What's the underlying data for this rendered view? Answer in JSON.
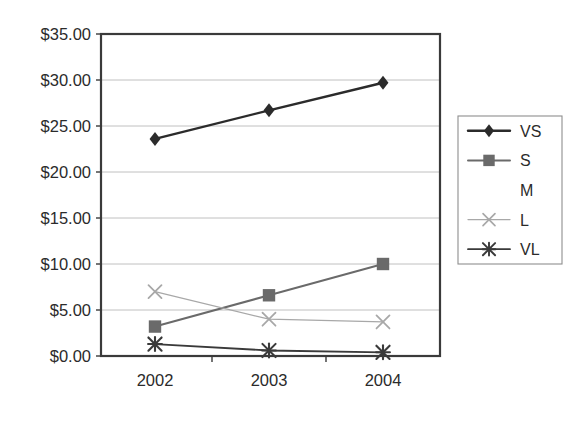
{
  "chart_data": {
    "type": "line",
    "title": "",
    "subtitle": "",
    "xlabel": "",
    "ylabel": "",
    "categories": [
      "2002",
      "2003",
      "2004"
    ],
    "x_tick_labels": [
      "2002",
      "2003",
      "2004"
    ],
    "y_tick_labels": [
      "$0.00",
      "$5.00",
      "$10.00",
      "$15.00",
      "$20.00",
      "$25.00",
      "$30.00",
      "$35.00"
    ],
    "y_tick_values": [
      0,
      5,
      10,
      15,
      20,
      25,
      30,
      35
    ],
    "ylim": [
      0,
      35
    ],
    "y_tick_step": 5,
    "grid": "horizontal",
    "legend_position": "right",
    "legend_entries": [
      "VS",
      "S",
      "M",
      "L",
      "VL"
    ],
    "series": [
      {
        "name": "VS",
        "marker": "diamond",
        "color": "#2b2b2b",
        "line_width": 2.4,
        "values": [
          23.6,
          26.7,
          29.7
        ]
      },
      {
        "name": "S",
        "marker": "square",
        "color": "#6a6a6a",
        "line_width": 2.0,
        "values": [
          3.2,
          6.6,
          10.0
        ]
      },
      {
        "name": "M",
        "marker": "none",
        "color": "#e8e8e8",
        "line_width": 0,
        "values": [
          null,
          null,
          null
        ]
      },
      {
        "name": "L",
        "marker": "x",
        "color": "#a8a8a8",
        "line_width": 1.3,
        "values": [
          7.0,
          4.0,
          3.7
        ]
      },
      {
        "name": "VL",
        "marker": "star",
        "color": "#3a3a3a",
        "line_width": 1.8,
        "values": [
          1.3,
          0.6,
          0.4
        ]
      }
    ]
  },
  "colors": {
    "background": "#ffffff",
    "axis": "#3a3a3a",
    "grid": "#b9b9b9",
    "text": "#2b2b2b",
    "legend_border": "#8e8e8e"
  }
}
